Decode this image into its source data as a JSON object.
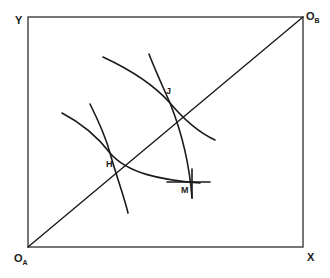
{
  "figure": {
    "type": "edgeworth-box",
    "background_color": "#ffffff",
    "stroke_color": "#1a1a1a",
    "box": {
      "left": 28,
      "top": 17,
      "right": 303,
      "bottom": 247,
      "border_color": "#4a4a4a",
      "border_width": 1.5
    }
  },
  "axes": {
    "y_label": "Y",
    "x_label": "X",
    "origin_a_letter": "O",
    "origin_a_subscript": "A",
    "origin_b_letter": "O",
    "origin_b_subscript": "B"
  },
  "points": [
    {
      "label": "H",
      "x": 110,
      "y": 153,
      "label_x": 106,
      "label_y": 160
    },
    {
      "label": "J",
      "x": 170,
      "y": 103,
      "label_x": 166,
      "label_y": 87
    },
    {
      "label": "M",
      "x": 192,
      "y": 182,
      "label_x": 181,
      "label_y": 186
    }
  ],
  "curves": {
    "contract_curve": {
      "name": "contract-curve",
      "description": "straight diagonal from origin A to origin B",
      "path": "M 28 247 L 303 17"
    },
    "indifference_a_low": {
      "name": "indifference-curve-a-low",
      "description": "convex-to-OA curve through H",
      "path": "M 62 113 C 85 125, 100 140, 110 153 C 127 173, 160 180, 200 183"
    },
    "indifference_b_low": {
      "name": "indifference-curve-b-low",
      "description": "convex-to-OB curve through H",
      "path": "M 90 104 C 99 122, 106 138, 110 153 C 116 175, 124 196, 128 213"
    },
    "indifference_a_high": {
      "name": "indifference-curve-a-high",
      "description": "convex-to-OA curve through J",
      "path": "M 103 57 C 131 70, 155 86, 170 103 C 186 122, 202 134, 215 140"
    },
    "indifference_b_high": {
      "name": "indifference-curve-b-high",
      "description": "convex-to-OB curve through J continuing to M",
      "path": "M 149 54 C 155 70, 164 89, 170 103 C 180 128, 189 158, 192 198"
    },
    "marker_m_horizontal": {
      "name": "marker-m-horizontal",
      "path": "M 167 182 L 210 182"
    },
    "marker_m_vertical": {
      "name": "marker-m-vertical",
      "path": "M 192 169 L 192 198"
    }
  }
}
